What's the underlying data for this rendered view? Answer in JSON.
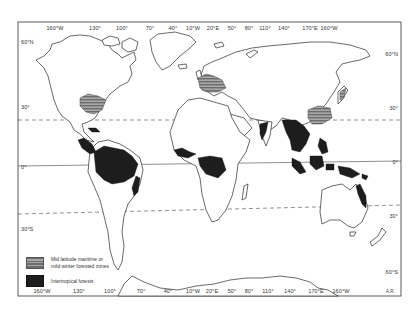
{
  "map": {
    "title": "World distribution of forest zones",
    "frame": {
      "x": 18,
      "y": 22,
      "width": 383,
      "height": 274
    },
    "equator_y": 163,
    "tropic_cancer_y": [
      118,
      114
    ],
    "tropic_capricorn_y": [
      212,
      205
    ],
    "colors": {
      "land_outline": "#2a2a2a",
      "tropical": "#1d1d1d",
      "hatched_dark": "#6c6c6c",
      "hatched_light": "#a8a8a8",
      "dashed_line": "#444444",
      "background": "#ffffff"
    }
  },
  "top_axis": [
    {
      "label": "160°W",
      "x": 55
    },
    {
      "label": "130°",
      "x": 95
    },
    {
      "label": "100°",
      "x": 122
    },
    {
      "label": "70°",
      "x": 150
    },
    {
      "label": "40°",
      "x": 173
    },
    {
      "label": "10°W",
      "x": 193
    },
    {
      "label": "20°E",
      "x": 213
    },
    {
      "label": "50°",
      "x": 232
    },
    {
      "label": "80°",
      "x": 249
    },
    {
      "label": "110°",
      "x": 265
    },
    {
      "label": "140°",
      "x": 284
    },
    {
      "label": "170°E",
      "x": 310
    },
    {
      "label": "160°W",
      "x": 329
    }
  ],
  "bottom_axis": [
    {
      "label": "160°W",
      "x": 42
    },
    {
      "label": "130°",
      "x": 79
    },
    {
      "label": "100°",
      "x": 110
    },
    {
      "label": "70°",
      "x": 141
    },
    {
      "label": "40°",
      "x": 168
    },
    {
      "label": "10°W",
      "x": 193
    },
    {
      "label": "20°E",
      "x": 212
    },
    {
      "label": "50°",
      "x": 232
    },
    {
      "label": "80°",
      "x": 249
    },
    {
      "label": "110°",
      "x": 268
    },
    {
      "label": "140°",
      "x": 290
    },
    {
      "label": "170°E",
      "x": 316
    },
    {
      "label": "160°W",
      "x": 341
    }
  ],
  "left_axis": [
    {
      "label": "60°N",
      "y": 42
    },
    {
      "label": "30°",
      "y": 107
    },
    {
      "label": "0°",
      "y": 167
    },
    {
      "label": "30°S",
      "y": 229
    }
  ],
  "right_axis": [
    {
      "label": "60°N",
      "y": 54
    },
    {
      "label": "30°",
      "y": 108
    },
    {
      "label": "0°",
      "y": 162
    },
    {
      "label": "30°",
      "y": 216
    },
    {
      "label": "60°S",
      "y": 272
    }
  ],
  "legend": {
    "items": [
      {
        "label_line1": "Mid latitude maritime or",
        "label_line2": "mild winter forested zones",
        "pattern": "hatched"
      },
      {
        "label_line1": "Intertropical forests",
        "label_line2": "",
        "pattern": "solid-black"
      }
    ]
  },
  "credit": "A.R."
}
